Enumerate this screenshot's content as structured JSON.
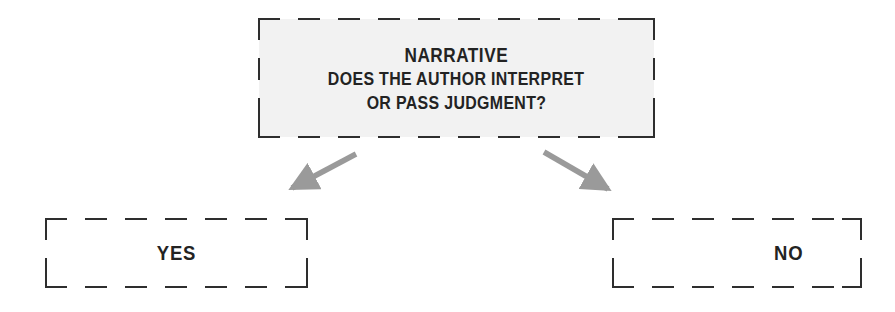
{
  "diagram": {
    "type": "decision-flowchart",
    "background_color": "#ffffff",
    "border_color": "#2e2e2e",
    "text_color": "#232323",
    "arrow_color": "#9a9a9a",
    "question_fill_color": "#f2f2f2",
    "question_node": {
      "title": "NARRATIVE",
      "line_1": "DOES THE AUTHOR INTERPRET",
      "line_2": "OR PASS JUDGMENT?"
    },
    "branches": [
      {
        "label": "YES",
        "direction": "down-left"
      },
      {
        "label": "NO",
        "direction": "down-right"
      }
    ],
    "arrows": [
      {
        "name": "arrow-to-yes",
        "tail_x": 356,
        "tail_y": 154,
        "head_x": 286,
        "head_y": 191
      },
      {
        "name": "arrow-to-no",
        "tail_x": 544,
        "tail_y": 152,
        "head_x": 614,
        "head_y": 193
      }
    ]
  }
}
